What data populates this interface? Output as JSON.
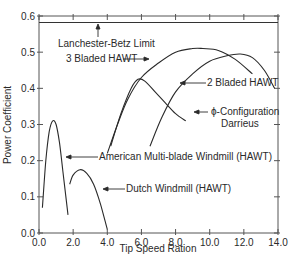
{
  "chart_data": {
    "type": "line",
    "title": "",
    "xlabel": "Tip Speed Ration",
    "ylabel": "Power Coefficient",
    "xlim": [
      0,
      14
    ],
    "ylim": [
      0,
      0.6
    ],
    "x_ticks": [
      "0.0",
      "2.0",
      "4.0",
      "6.0",
      "8.0",
      "10.0",
      "12.0",
      "14.0"
    ],
    "y_ticks": [
      "0.0",
      "0.1",
      "0.2",
      "0.3",
      "0.4",
      "0.5",
      "0.6"
    ],
    "grid": false,
    "reference_lines": [
      {
        "name": "Lanchester-Betz Limit",
        "y": 0.593
      }
    ],
    "series": [
      {
        "name": "3 Bladed HAWT",
        "x": [
          4.0,
          4.6,
          5.2,
          6.0,
          7.0,
          8.0,
          9.0,
          9.6,
          10.5,
          11.5,
          12.5
        ],
        "y": [
          0.22,
          0.3,
          0.37,
          0.43,
          0.47,
          0.5,
          0.51,
          0.51,
          0.505,
          0.48,
          0.44
        ]
      },
      {
        "name": "2 Bladed HAWT",
        "x": [
          6.5,
          7.2,
          8.0,
          9.0,
          10.0,
          11.0,
          11.8,
          12.5,
          13.2,
          13.8
        ],
        "y": [
          0.24,
          0.32,
          0.39,
          0.44,
          0.475,
          0.49,
          0.495,
          0.485,
          0.45,
          0.4
        ]
      },
      {
        "name": "ϕ-Configuration Darrieus",
        "x": [
          4.2,
          4.8,
          5.4,
          5.8,
          6.2,
          6.8,
          7.4,
          8.0,
          8.6
        ],
        "y": [
          0.24,
          0.33,
          0.4,
          0.425,
          0.42,
          0.39,
          0.36,
          0.33,
          0.31
        ]
      },
      {
        "name": "American Multi-blade Windmill (HAWT)",
        "x": [
          0.2,
          0.4,
          0.6,
          0.8,
          1.0,
          1.2,
          1.4,
          1.6,
          1.7
        ],
        "y": [
          0.07,
          0.2,
          0.28,
          0.31,
          0.3,
          0.25,
          0.17,
          0.09,
          0.05
        ]
      },
      {
        "name": "Dutch Windmill (HAWT)",
        "x": [
          1.8,
          2.0,
          2.4,
          2.8,
          3.2,
          3.6,
          4.0
        ],
        "y": [
          0.135,
          0.16,
          0.175,
          0.165,
          0.135,
          0.08,
          0.01
        ]
      }
    ],
    "annotations": [
      {
        "text": "Lanchester-Betz Limit"
      },
      {
        "text": "3 Bladed HAWT"
      },
      {
        "text": "2 Bladed HAWT"
      },
      {
        "text": "ϕ-Configuration"
      },
      {
        "text": "Darrieus"
      },
      {
        "text": "American Multi-blade Windmill (HAWT)"
      },
      {
        "text": "Dutch Windmill (HAWT)"
      }
    ]
  },
  "labels": {
    "betz": "Lanchester-Betz Limit",
    "three_bladed": "3 Bladed HAWT",
    "two_bladed": "2 Bladed HAWT",
    "darrieus_line1": "ϕ-Configuration",
    "darrieus_line2": "Darrieus",
    "american": "American Multi-blade Windmill (HAWT)",
    "dutch": "Dutch Windmill (HAWT)"
  },
  "colors": {
    "line": "#2a2a2a",
    "axis": "#555555",
    "background": "#ffffff"
  }
}
